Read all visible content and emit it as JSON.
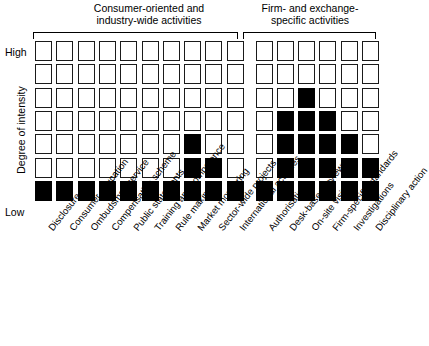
{
  "chart_data": {
    "type": "heatmap",
    "title": "",
    "xlabel": "",
    "ylabel": "Degree of intensity",
    "y_axis": {
      "top_label": "High",
      "bottom_label": "Low",
      "levels": 7,
      "ticks": [
        "Low",
        "",
        "",
        "",
        "",
        "",
        "High"
      ]
    },
    "grid": {
      "rows": 7,
      "columns": 16,
      "filled_color": "#000000",
      "empty_color": "#ffffff",
      "border_color": "#1a1a1a",
      "fill_direction": "bottom-up"
    },
    "groups": [
      {
        "label": "Consumer-oriented and\nindustry-wide activities",
        "start_index": 0,
        "end_index": 9,
        "column_count": 10
      },
      {
        "label": "Firm- and exchange-\nspecific activities",
        "start_index": 10,
        "end_index": 15,
        "column_count": 6
      }
    ],
    "categories": [
      "Disclosure",
      "Consumer education",
      "Ombudsman service",
      "Compensation scheme",
      "Public statements",
      "Training and competence",
      "Rule making",
      "Market monitoring",
      "Sector-wide projects",
      "International activities",
      "Authorisation",
      "Desk-based reviews",
      "On-site visits",
      "Firm-specific standards",
      "Investigations",
      "Disciplinary action"
    ],
    "values": [
      1,
      1,
      1,
      1,
      1,
      1,
      1,
      3,
      2,
      1,
      1,
      4,
      5,
      4,
      3,
      2
    ],
    "ylim": [
      0,
      7
    ],
    "legend": "none",
    "gridlines": false
  }
}
